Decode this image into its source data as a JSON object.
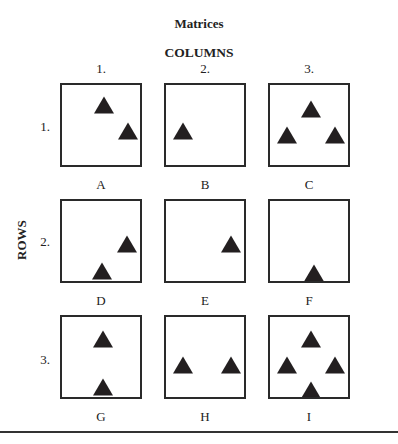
{
  "title": "Matrices",
  "columns_label": "COLUMNS",
  "rows_label": "ROWS",
  "column_numbers": [
    "1.",
    "2.",
    "3."
  ],
  "row_numbers": [
    "1.",
    "2.",
    "3."
  ],
  "triangle_color": "#231f20",
  "cells": [
    {
      "label": "A",
      "row": 1,
      "col": 1,
      "triangles": [
        [
          42,
          20
        ],
        [
          66,
          46
        ]
      ]
    },
    {
      "label": "B",
      "row": 1,
      "col": 2,
      "triangles": [
        [
          17,
          46
        ]
      ]
    },
    {
      "label": "C",
      "row": 1,
      "col": 3,
      "triangles": [
        [
          41,
          24
        ],
        [
          17,
          50
        ],
        [
          65,
          50
        ]
      ]
    },
    {
      "label": "D",
      "row": 2,
      "col": 1,
      "triangles": [
        [
          65,
          43
        ],
        [
          40,
          70
        ]
      ]
    },
    {
      "label": "E",
      "row": 2,
      "col": 2,
      "triangles": [
        [
          65,
          43
        ]
      ]
    },
    {
      "label": "F",
      "row": 2,
      "col": 3,
      "triangles": [
        [
          44,
          72
        ]
      ]
    },
    {
      "label": "G",
      "row": 3,
      "col": 1,
      "triangles": [
        [
          41,
          22
        ],
        [
          41,
          70
        ]
      ]
    },
    {
      "label": "H",
      "row": 3,
      "col": 2,
      "triangles": [
        [
          17,
          48
        ],
        [
          65,
          48
        ]
      ]
    },
    {
      "label": "I",
      "row": 3,
      "col": 3,
      "triangles": [
        [
          41,
          22
        ],
        [
          17,
          48
        ],
        [
          65,
          48
        ],
        [
          41,
          73
        ]
      ]
    }
  ]
}
